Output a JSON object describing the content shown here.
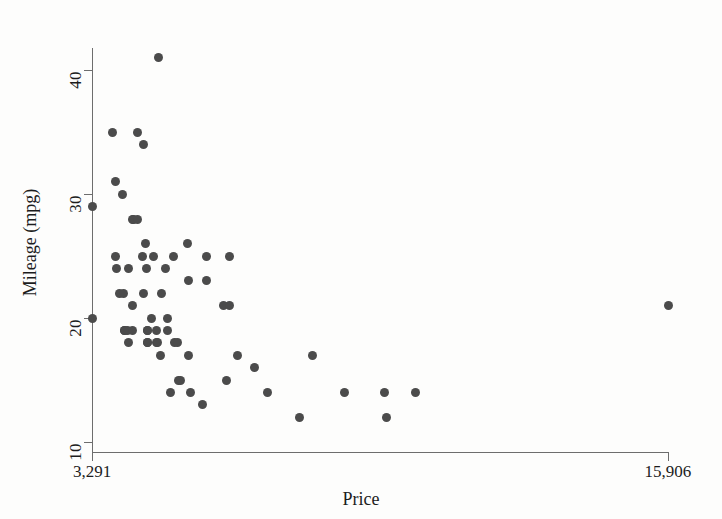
{
  "chart_data": {
    "type": "scatter",
    "title": "",
    "xlabel": "Price",
    "ylabel": "Mileage (mpg)",
    "xlim": [
      3291,
      15906
    ],
    "ylim": [
      9.2,
      41.8
    ],
    "grid": false,
    "legend": null,
    "marker": {
      "shape": "circle",
      "color": "#4b4b4b",
      "size": 9
    },
    "xticks": [
      3291,
      15906
    ],
    "xtick_labels": [
      "3,291",
      "15,906"
    ],
    "yticks": [
      10,
      20,
      30,
      40
    ],
    "ytick_labels": [
      "10",
      "20",
      "30",
      "40"
    ],
    "series": [
      {
        "name": "Automobiles",
        "points": [
          {
            "x": 3291,
            "y": 29
          },
          {
            "x": 3299,
            "y": 20
          },
          {
            "x": 3748,
            "y": 35
          },
          {
            "x": 3798,
            "y": 31
          },
          {
            "x": 3799,
            "y": 25
          },
          {
            "x": 3829,
            "y": 24
          },
          {
            "x": 3895,
            "y": 22
          },
          {
            "x": 3955,
            "y": 30
          },
          {
            "x": 3984,
            "y": 22
          },
          {
            "x": 3995,
            "y": 19
          },
          {
            "x": 4010,
            "y": 19
          },
          {
            "x": 4060,
            "y": 19
          },
          {
            "x": 4082,
            "y": 18
          },
          {
            "x": 4099,
            "y": 24
          },
          {
            "x": 4172,
            "y": 21
          },
          {
            "x": 4181,
            "y": 19
          },
          {
            "x": 4187,
            "y": 28
          },
          {
            "x": 4195,
            "y": 28
          },
          {
            "x": 4296,
            "y": 35
          },
          {
            "x": 4296,
            "y": 28
          },
          {
            "x": 4389,
            "y": 25
          },
          {
            "x": 4424,
            "y": 34
          },
          {
            "x": 4425,
            "y": 22
          },
          {
            "x": 4453,
            "y": 26
          },
          {
            "x": 4482,
            "y": 24
          },
          {
            "x": 4499,
            "y": 19
          },
          {
            "x": 4504,
            "y": 18
          },
          {
            "x": 4504,
            "y": 19
          },
          {
            "x": 4516,
            "y": 18
          },
          {
            "x": 4589,
            "y": 20
          },
          {
            "x": 4647,
            "y": 25
          },
          {
            "x": 4696,
            "y": 19
          },
          {
            "x": 4697,
            "y": 18
          },
          {
            "x": 4723,
            "y": 18
          },
          {
            "x": 4749,
            "y": 41
          },
          {
            "x": 4782,
            "y": 17
          },
          {
            "x": 4816,
            "y": 22
          },
          {
            "x": 4890,
            "y": 24
          },
          {
            "x": 4934,
            "y": 20
          },
          {
            "x": 4941,
            "y": 19
          },
          {
            "x": 5006,
            "y": 14
          },
          {
            "x": 5079,
            "y": 25
          },
          {
            "x": 5104,
            "y": 18
          },
          {
            "x": 5172,
            "y": 18
          },
          {
            "x": 5189,
            "y": 15
          },
          {
            "x": 5222,
            "y": 15
          },
          {
            "x": 5379,
            "y": 26
          },
          {
            "x": 5397,
            "y": 23
          },
          {
            "x": 5399,
            "y": 17
          },
          {
            "x": 5459,
            "y": 14
          },
          {
            "x": 5705,
            "y": 13
          },
          {
            "x": 5788,
            "y": 25
          },
          {
            "x": 5798,
            "y": 23
          },
          {
            "x": 6165,
            "y": 21
          },
          {
            "x": 6229,
            "y": 15
          },
          {
            "x": 6295,
            "y": 21
          },
          {
            "x": 6303,
            "y": 25
          },
          {
            "x": 6486,
            "y": 17
          },
          {
            "x": 6850,
            "y": 16
          },
          {
            "x": 7140,
            "y": 14
          },
          {
            "x": 7827,
            "y": 12
          },
          {
            "x": 8129,
            "y": 17
          },
          {
            "x": 8814,
            "y": 14
          },
          {
            "x": 9690,
            "y": 14
          },
          {
            "x": 9735,
            "y": 12
          },
          {
            "x": 10372,
            "y": 14
          },
          {
            "x": 15906,
            "y": 21
          }
        ]
      }
    ]
  },
  "axes": {
    "x": {
      "title": "Price",
      "tick_labels": [
        "3,291",
        "15,906"
      ]
    },
    "y": {
      "title": "Mileage (mpg)",
      "tick_labels": [
        "10",
        "20",
        "30",
        "40"
      ]
    }
  },
  "colors": {
    "marker": "#4b4b4b",
    "axis": "#6d6d6d",
    "text": "#1c1c1c",
    "background": "#fdfdfc"
  }
}
